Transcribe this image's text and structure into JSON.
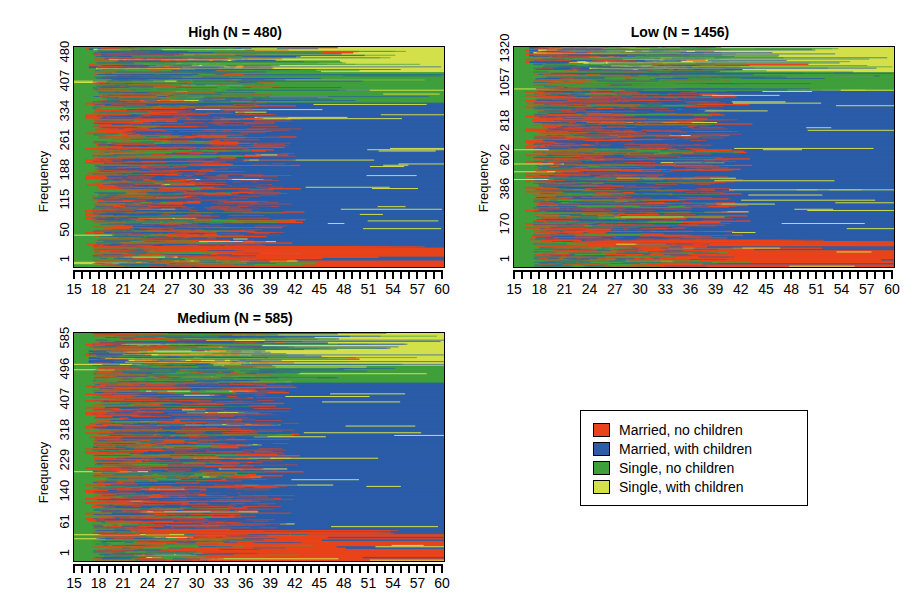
{
  "figure": {
    "kind": "sequence-index-plot",
    "xlabel": "",
    "ylabel": "Frequency"
  },
  "legend": {
    "items": [
      {
        "label": "Married, no children",
        "color": "#e8431a",
        "key": "married_no_children"
      },
      {
        "label": "Married, with children",
        "color": "#2a5ca8",
        "key": "married_with_children"
      },
      {
        "label": "Single, no children",
        "color": "#3f9f3a",
        "key": "single_no_children"
      },
      {
        "label": "Single, with children",
        "color": "#d4e04a",
        "key": "single_with_children"
      }
    ]
  },
  "panels": [
    {
      "id": "high",
      "title": "High (N = 480)",
      "ylabel": "Frequency",
      "yticks": [
        "1",
        "50",
        "115",
        "188",
        "261",
        "334",
        "407",
        "480"
      ],
      "xticklabels": [
        "15",
        "18",
        "21",
        "24",
        "27",
        "30",
        "33",
        "36",
        "39",
        "42",
        "45",
        "48",
        "51",
        "54",
        "57",
        "60"
      ],
      "xmin": 15,
      "xmax": 60,
      "n": 480
    },
    {
      "id": "low",
      "title": "Low (N = 1456)",
      "ylabel": "Frequency",
      "yticks": [
        "1",
        "170",
        "386",
        "602",
        "818",
        "1057",
        "1320"
      ],
      "xticklabels": [
        "15",
        "18",
        "21",
        "24",
        "27",
        "30",
        "33",
        "36",
        "39",
        "42",
        "45",
        "48",
        "51",
        "54",
        "57",
        "60"
      ],
      "xmin": 15,
      "xmax": 60,
      "n": 1456
    },
    {
      "id": "medium",
      "title": "Medium (N = 585)",
      "ylabel": "Frequency",
      "yticks": [
        "1",
        "61",
        "140",
        "229",
        "318",
        "407",
        "496",
        "585"
      ],
      "xticklabels": [
        "15",
        "18",
        "21",
        "24",
        "27",
        "30",
        "33",
        "36",
        "39",
        "42",
        "45",
        "48",
        "51",
        "54",
        "57",
        "60"
      ],
      "xmin": 15,
      "xmax": 60,
      "n": 585
    }
  ],
  "chart_data": {
    "type": "heatmap",
    "title": "",
    "xlabel": "Age",
    "ylabel": "Frequency",
    "x": [
      15,
      18,
      21,
      24,
      27,
      30,
      33,
      36,
      39,
      42,
      45,
      48,
      51,
      54,
      57,
      60
    ],
    "xlim": [
      15,
      60
    ],
    "grid": false,
    "legend_position": "bottom-right",
    "categories": [
      "Married, no children",
      "Married, with children",
      "Single, no children",
      "Single, with children"
    ],
    "category_colors": [
      "#e8431a",
      "#2a5ca8",
      "#3f9f3a",
      "#d4e04a"
    ],
    "panels": [
      {
        "name": "High (N = 480)",
        "n": 480,
        "ylim": [
          1,
          480
        ],
        "yticks": [
          1,
          50,
          115,
          188,
          261,
          334,
          407,
          480
        ],
        "approx_terminal_shares": {
          "single_no_children": 0.14,
          "married_with_children": 0.66,
          "married_no_children": 0.09,
          "single_with_children": 0.11
        }
      },
      {
        "name": "Low (N = 1456)",
        "n": 1456,
        "ylim": [
          1,
          1320
        ],
        "yticks": [
          1,
          170,
          386,
          602,
          818,
          1057,
          1320
        ],
        "approx_terminal_shares": {
          "single_no_children": 0.09,
          "married_with_children": 0.68,
          "married_no_children": 0.12,
          "single_with_children": 0.11
        }
      },
      {
        "name": "Medium (N = 585)",
        "n": 585,
        "ylim": [
          1,
          585
        ],
        "yticks": [
          1,
          61,
          140,
          229,
          318,
          407,
          496,
          585
        ],
        "approx_terminal_shares": {
          "single_no_children": 0.08,
          "married_with_children": 0.65,
          "married_no_children": 0.13,
          "single_with_children": 0.14
        }
      }
    ]
  }
}
